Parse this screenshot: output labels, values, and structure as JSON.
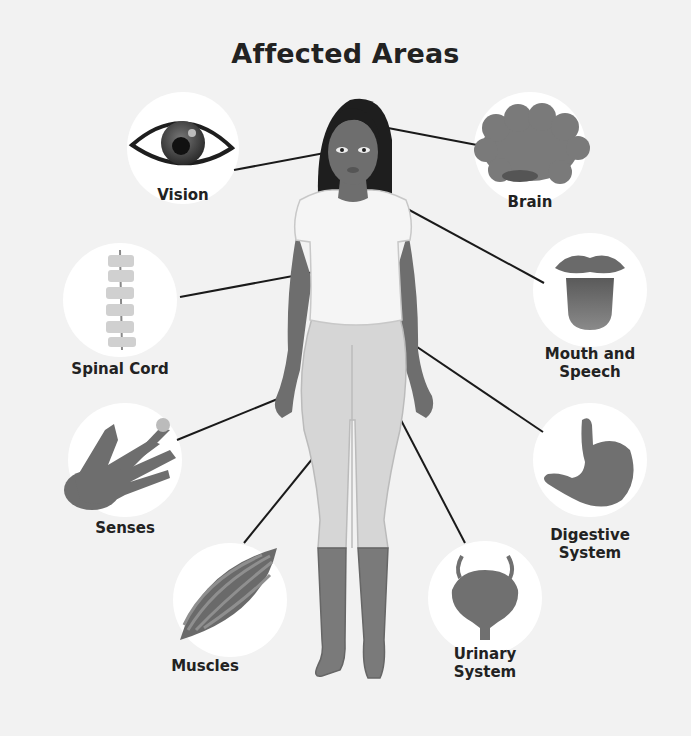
{
  "title": "Affected Areas",
  "figure": {
    "colors": {
      "background": "#f2f2f2",
      "circle": "#ffffff",
      "hair": "#1e1e1e",
      "skin": "#6e6e6e",
      "shirt": "#f5f5f5",
      "leggings": "#d6d6d6",
      "boots": "#7a7a7a",
      "icon_gray": "#707070",
      "line": "#1a1a1a"
    }
  },
  "areas": [
    {
      "id": "vision",
      "label": "Vision",
      "icon": "eye-icon"
    },
    {
      "id": "brain",
      "label": "Brain",
      "icon": "brain-icon"
    },
    {
      "id": "spinal-cord",
      "label": "Spinal Cord",
      "icon": "spine-icon"
    },
    {
      "id": "mouth-speech",
      "label_line1": "Mouth and",
      "label_line2": "Speech",
      "icon": "tongue-icon"
    },
    {
      "id": "senses",
      "label": "Senses",
      "icon": "hand-icon"
    },
    {
      "id": "digestive",
      "label_line1": "Digestive",
      "label_line2": "System",
      "icon": "stomach-icon"
    },
    {
      "id": "muscles",
      "label": "Muscles",
      "icon": "muscle-icon"
    },
    {
      "id": "urinary",
      "label_line1": "Urinary",
      "label_line2": "System",
      "icon": "bladder-icon"
    }
  ]
}
